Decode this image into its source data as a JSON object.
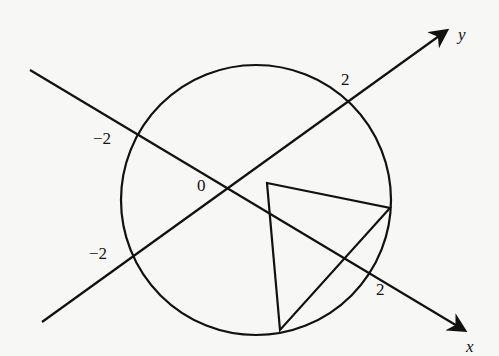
{
  "figure": {
    "axes": {
      "x": {
        "label": "x",
        "tick_positive": "2",
        "tick_negative": "−2"
      },
      "y": {
        "label": "y",
        "tick_positive": "2",
        "tick_negative": "−2"
      },
      "origin_label": "0"
    },
    "shapes": [
      {
        "type": "circle",
        "description": "circle through (±2,0),(0,±2) region"
      },
      {
        "type": "triangle",
        "description": "triangle inscribed with two vertices on circle"
      }
    ],
    "colors": {
      "stroke": "#111111",
      "background": "#f7f7f5"
    }
  }
}
